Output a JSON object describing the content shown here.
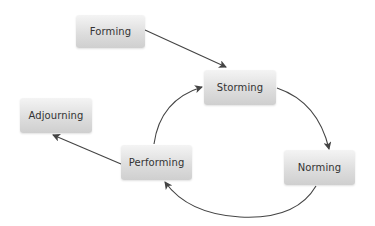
{
  "diagram": {
    "type": "cycle",
    "nodes": [
      {
        "id": "forming",
        "label": "Forming",
        "x": 76,
        "y": 15,
        "w": 69,
        "h": 33
      },
      {
        "id": "storming",
        "label": "Storming",
        "x": 204,
        "y": 70,
        "w": 72,
        "h": 35
      },
      {
        "id": "norming",
        "label": "Norming",
        "x": 284,
        "y": 150,
        "w": 71,
        "h": 35
      },
      {
        "id": "performing",
        "label": "Performing",
        "x": 121,
        "y": 145,
        "w": 71,
        "h": 35
      },
      {
        "id": "adjourning",
        "label": "Adjourning",
        "x": 20,
        "y": 98,
        "w": 72,
        "h": 35
      }
    ],
    "edges": [
      {
        "from": "forming",
        "to": "storming"
      },
      {
        "from": "storming",
        "to": "norming"
      },
      {
        "from": "norming",
        "to": "performing"
      },
      {
        "from": "performing",
        "to": "storming"
      },
      {
        "from": "performing",
        "to": "adjourning"
      }
    ],
    "colors": {
      "edge": "#444444",
      "node_top": "#f4f4f4",
      "node_bottom": "#cfcfcf",
      "text": "#333333"
    }
  }
}
